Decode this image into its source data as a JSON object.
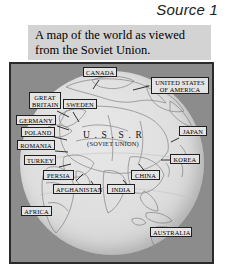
{
  "title": "Source 1",
  "caption": {
    "line1": "A map of the world as viewed",
    "line2": "from the Soviet Union."
  },
  "map": {
    "center_label": {
      "name": "U . S . S . R",
      "subtitle": "(SOVIET UNION)"
    },
    "labels": [
      {
        "id": "canada",
        "text": "CANADA"
      },
      {
        "id": "united-states",
        "text": "UNITED STATES",
        "text2": "OF AMERICA"
      },
      {
        "id": "great-britain",
        "text": "GREAT",
        "text2": "BRITAIN"
      },
      {
        "id": "sweden",
        "text": "SWEDEN"
      },
      {
        "id": "germany",
        "text": "GERMANY"
      },
      {
        "id": "poland",
        "text": "POLAND"
      },
      {
        "id": "romania",
        "text": "ROMANIA"
      },
      {
        "id": "turkey",
        "text": "TURKEY"
      },
      {
        "id": "persia",
        "text": "PERSIA"
      },
      {
        "id": "afghanistan",
        "text": "AFGHANISTAN"
      },
      {
        "id": "india",
        "text": "INDIA"
      },
      {
        "id": "china",
        "text": "CHINA"
      },
      {
        "id": "korea",
        "text": "KOREA"
      },
      {
        "id": "japan",
        "text": "JAPAN"
      },
      {
        "id": "africa",
        "text": "AFRICA"
      },
      {
        "id": "australia",
        "text": "AUSTRALIA"
      }
    ]
  },
  "colors": {
    "page_background": "#ffffff",
    "caption_background": "#d3d3d3",
    "map_background": "#8c8c8c",
    "globe_fill": "#dedede",
    "frame_border": "#2a2a2a",
    "label_background": "#e4e4e4",
    "text": "#000000"
  }
}
